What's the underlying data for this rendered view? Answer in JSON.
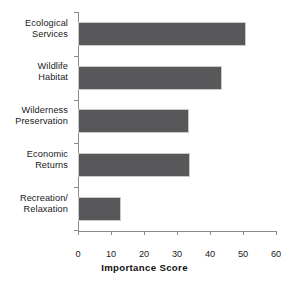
{
  "chart_data": {
    "type": "bar",
    "orientation": "horizontal",
    "title": "",
    "xlabel": "Importance Score",
    "ylabel": "",
    "xlim": [
      0,
      60
    ],
    "xticks": [
      0,
      10,
      20,
      30,
      40,
      50,
      60
    ],
    "xtick_labels": [
      "0",
      "10",
      "20",
      "30",
      "40",
      "50",
      "60"
    ],
    "grid": false,
    "legend": null,
    "bar_color": "#58585a",
    "bar_edge_color": "#c9c9c9",
    "axis_color": "#8a8a8a",
    "text_color": "#1a1a1a",
    "categories": [
      "Ecological Services",
      "Wildlife Habitat",
      "Wilderness Preservation",
      "Economic Returns",
      "Recreation/ Relaxation"
    ],
    "category_lines": [
      [
        "Ecological",
        "Services"
      ],
      [
        "Wildlife",
        "Habitat"
      ],
      [
        "Wilderness",
        "Preservation"
      ],
      [
        "Economic",
        "Returns"
      ],
      [
        "Recreation/",
        "Relaxation"
      ]
    ],
    "values": [
      51,
      43.5,
      33.5,
      34,
      13
    ]
  }
}
